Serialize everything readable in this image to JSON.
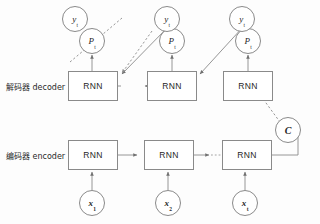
{
  "diagram": {
    "colors": {
      "stroke": "#8a8a8a",
      "text": "#1f1f1f",
      "background": "#fdfdfd"
    },
    "rows": {
      "decoder_label": "解码器 decoder",
      "encoder_label": "编码器 encoder"
    },
    "decoder": {
      "cells": [
        {
          "label": "RNN"
        },
        {
          "label": "RNN"
        },
        {
          "label": "RNN"
        }
      ],
      "outputs": [
        {
          "prob": "P",
          "prob_sub": "t",
          "token": "y",
          "token_sub": "t"
        },
        {
          "prob": "P",
          "prob_sub": "t",
          "token": "y",
          "token_sub": "t"
        },
        {
          "prob": "P",
          "prob_sub": "t",
          "token": "y",
          "token_sub": "t"
        }
      ]
    },
    "encoder": {
      "cells": [
        {
          "label": "RNN"
        },
        {
          "label": "RNN"
        },
        {
          "label": "RNN"
        }
      ],
      "inputs": [
        {
          "token": "x",
          "token_sub": "1"
        },
        {
          "token": "x",
          "token_sub": "2"
        },
        {
          "token": "x",
          "token_sub": "t"
        }
      ],
      "ellipsis": "·····"
    },
    "context": {
      "label": "C"
    }
  }
}
